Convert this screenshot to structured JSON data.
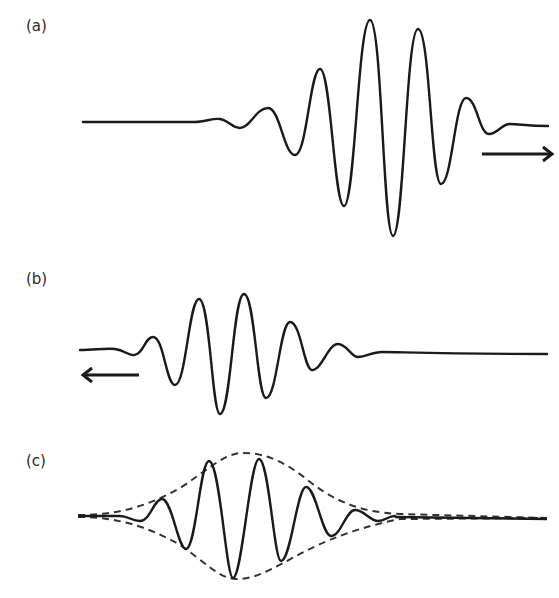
{
  "figure": {
    "panels": [
      {
        "label": "(a)",
        "direction": "right",
        "arrow": "right-arrow"
      },
      {
        "label": "(b)",
        "direction": "left",
        "arrow": "left-arrow"
      },
      {
        "label": "(c)",
        "envelope": "dashed"
      }
    ],
    "colors": {
      "line": "#1a1a1a",
      "envelope": "#333333",
      "background": "#ffffff"
    }
  }
}
